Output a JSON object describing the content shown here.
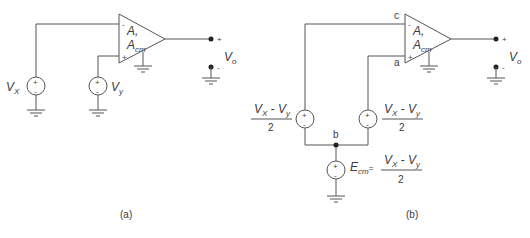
{
  "figure": {
    "panels": [
      {
        "id": "a",
        "caption": "(a)",
        "opamp": {
          "gain_label": "A,",
          "cm_gain_main": "A",
          "cm_gain_sub": "cm",
          "inv_input": "-",
          "noninv_input": "+"
        },
        "sources": [
          {
            "name": "V",
            "sub": "X",
            "polarity_top": "+",
            "polarity_bottom": "-"
          },
          {
            "name": "V",
            "sub": "y",
            "polarity_top": "+",
            "polarity_bottom": "-"
          }
        ],
        "output": {
          "name": "V",
          "sub": "o",
          "plus": "+",
          "minus": "-"
        }
      },
      {
        "id": "b",
        "caption": "(b)",
        "opamp": {
          "gain_label": "A,",
          "cm_gain_main": "A",
          "cm_gain_sub": "cm",
          "inv_input": "-",
          "noninv_input": "+"
        },
        "nodes": {
          "c": "c",
          "a": "a",
          "b": "b"
        },
        "diff_sources": [
          {
            "num_v1": "V",
            "num_s1": "X",
            "minus": " - ",
            "num_v2": "V",
            "num_s2": "y",
            "den": "2",
            "polarity_top": "+",
            "polarity_bottom": "-"
          },
          {
            "num_v1": "V",
            "num_s1": "X",
            "minus": " - ",
            "num_v2": "V",
            "num_s2": "y",
            "den": "2",
            "polarity_top": "+",
            "polarity_bottom": "-"
          }
        ],
        "cm_source": {
          "name": "E",
          "sub": "cm",
          "eq": "=",
          "num_v1": "V",
          "num_s1": "X",
          "minus": " - ",
          "num_v2": "V",
          "num_s2": "y",
          "den": "2",
          "polarity_top": "+",
          "polarity_bottom": "-"
        },
        "output": {
          "name": "V",
          "sub": "o",
          "plus": "+",
          "minus": "-"
        }
      }
    ]
  }
}
